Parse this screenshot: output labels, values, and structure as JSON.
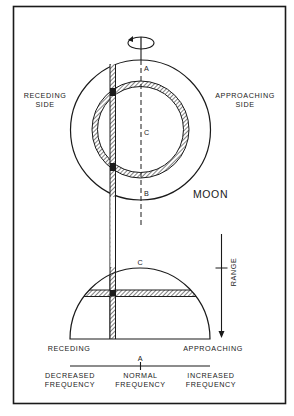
{
  "figure": {
    "labels": {
      "receding_side_1": "RECEDING",
      "receding_side_2": "SIDE",
      "approaching_side_1": "APPROACHING",
      "approaching_side_2": "SIDE",
      "point_a_top": "A",
      "point_c_center": "C",
      "point_b": "B",
      "moon": "MOON",
      "point_c_dome": "C",
      "range": "RANGE",
      "receding": "RECEDING",
      "approaching": "APPROACHING",
      "point_a_axis": "A",
      "decreased_1": "DECREASED",
      "decreased_2": "FREQUENCY",
      "normal_1": "NORMAL",
      "normal_2": "FREQUENCY",
      "increased_1": "INCREASED",
      "increased_2": "FREQUENCY"
    },
    "colors": {
      "ink": "#1a1a1a",
      "background": "#ffffff"
    }
  }
}
